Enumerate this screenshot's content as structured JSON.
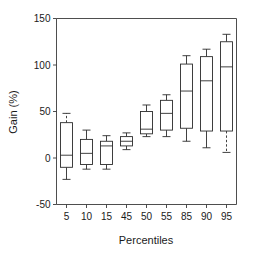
{
  "chart_data": {
    "type": "box",
    "title": "",
    "xlabel": "Percentiles",
    "ylabel": "Gain (%)",
    "categories": [
      "5",
      "10",
      "15",
      "45",
      "50",
      "55",
      "85",
      "90",
      "95"
    ],
    "ylim": [
      -50,
      150
    ],
    "yticks": [
      -50,
      0,
      50,
      100,
      150
    ],
    "ytick_labels": [
      "-50",
      "0",
      "50",
      "100",
      "150"
    ],
    "grid": false,
    "legend": null,
    "boxes": [
      {
        "category": "5",
        "whisker_low": -23,
        "q1": -10,
        "median": 3,
        "q3": 38,
        "whisker_high": 48,
        "dashed_low": false,
        "dashed_high": true
      },
      {
        "category": "10",
        "whisker_low": -12,
        "q1": -7,
        "median": 5,
        "q3": 20,
        "whisker_high": 30,
        "dashed_low": false,
        "dashed_high": false
      },
      {
        "category": "15",
        "whisker_low": -12,
        "q1": -7,
        "median": 13,
        "q3": 18,
        "whisker_high": 24,
        "dashed_low": false,
        "dashed_high": false
      },
      {
        "category": "45",
        "whisker_low": 9,
        "q1": 13,
        "median": 18,
        "q3": 23,
        "whisker_high": 27,
        "dashed_low": false,
        "dashed_high": false
      },
      {
        "category": "50",
        "whisker_low": 23,
        "q1": 26,
        "median": 31,
        "q3": 50,
        "whisker_high": 57,
        "dashed_low": false,
        "dashed_high": false
      },
      {
        "category": "55",
        "whisker_low": 23,
        "q1": 30,
        "median": 48,
        "q3": 62,
        "whisker_high": 68,
        "dashed_low": false,
        "dashed_high": false
      },
      {
        "category": "85",
        "whisker_low": 18,
        "q1": 32,
        "median": 72,
        "q3": 101,
        "whisker_high": 110,
        "dashed_low": false,
        "dashed_high": false
      },
      {
        "category": "90",
        "whisker_low": 11,
        "q1": 29,
        "median": 83,
        "q3": 109,
        "whisker_high": 117,
        "dashed_low": false,
        "dashed_high": false
      },
      {
        "category": "95",
        "whisker_low": 6,
        "q1": 29,
        "median": 98,
        "q3": 125,
        "whisker_high": 133,
        "dashed_low": true,
        "dashed_high": false
      }
    ]
  },
  "axes": {
    "ylabel": "Gain (%)",
    "xlabel": "Percentiles"
  }
}
